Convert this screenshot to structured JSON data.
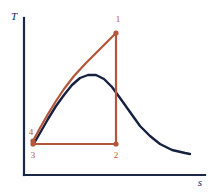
{
  "figure": {
    "background_color": "#ffffff",
    "width": 212,
    "height": 195
  },
  "axes": {
    "y_label": "T",
    "x_label": "s",
    "color": "#1a2847",
    "origin": {
      "x": 24,
      "y": 175
    },
    "y_top": 18,
    "x_right": 205
  },
  "colors": {
    "cycle": "#b4563a",
    "dome": "#15213f",
    "axis": "#1a2847"
  },
  "chart_data": {
    "type": "line",
    "xlabel": "s",
    "ylabel": "T",
    "grid": false,
    "legend": "none",
    "xlim": [
      24,
      205
    ],
    "ylim": [
      175,
      18
    ],
    "series": [
      {
        "name": "saturation-dome",
        "color": "#15213f",
        "points": [
          [
            33,
            145
          ],
          [
            40,
            133
          ],
          [
            48,
            119
          ],
          [
            56,
            106
          ],
          [
            64,
            95
          ],
          [
            72,
            85
          ],
          [
            80,
            78
          ],
          [
            88,
            75
          ],
          [
            96,
            75
          ],
          [
            104,
            79
          ],
          [
            112,
            87
          ],
          [
            120,
            98
          ],
          [
            130,
            112
          ],
          [
            140,
            126
          ],
          [
            150,
            136
          ],
          [
            160,
            144
          ],
          [
            172,
            150
          ],
          [
            185,
            153
          ],
          [
            190,
            154
          ]
        ]
      },
      {
        "name": "cycle-4-to-1",
        "color": "#b4563a",
        "points": [
          [
            33,
            141
          ],
          [
            40,
            128
          ],
          [
            48,
            114
          ],
          [
            56,
            101
          ],
          [
            64,
            89
          ],
          [
            74,
            76
          ],
          [
            86,
            63
          ],
          [
            98,
            51
          ],
          [
            108,
            41
          ],
          [
            116,
            33
          ]
        ]
      },
      {
        "name": "cycle-1-to-2",
        "color": "#b4563a",
        "points": [
          [
            116,
            33
          ],
          [
            116,
            144
          ]
        ]
      },
      {
        "name": "cycle-2-to-3",
        "color": "#b4563a",
        "points": [
          [
            116,
            144
          ],
          [
            33,
            144
          ]
        ]
      },
      {
        "name": "cycle-3-to-4",
        "color": "#b4563a",
        "points": [
          [
            33,
            144
          ],
          [
            33,
            141
          ]
        ]
      }
    ],
    "annotations": [
      {
        "label": "1",
        "x": 116,
        "y": 33,
        "label_x": 118,
        "label_y": 22
      },
      {
        "label": "2",
        "x": 116,
        "y": 144,
        "label_x": 116,
        "label_y": 158
      },
      {
        "label": "3",
        "x": 33,
        "y": 144,
        "label_x": 33,
        "label_y": 158
      },
      {
        "label": "4",
        "x": 33,
        "y": 141,
        "label_x": 31,
        "label_y": 133
      }
    ]
  },
  "labels": {
    "point_1": "1",
    "point_2": "2",
    "point_3": "3",
    "point_4": "4",
    "axis_y": "T",
    "axis_x": "s"
  }
}
